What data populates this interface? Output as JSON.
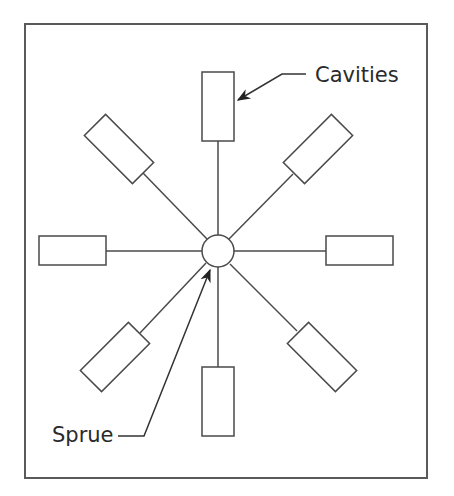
{
  "diagram": {
    "labels": {
      "cavities": "Cavities",
      "sprue": "Sprue"
    },
    "colors": {
      "stroke": "#4a4a4a",
      "background": "#ffffff",
      "text": "#2a2a2a"
    },
    "hub": {
      "cx": 218,
      "cy": 251,
      "r": 16
    },
    "cavity_count": 8
  }
}
